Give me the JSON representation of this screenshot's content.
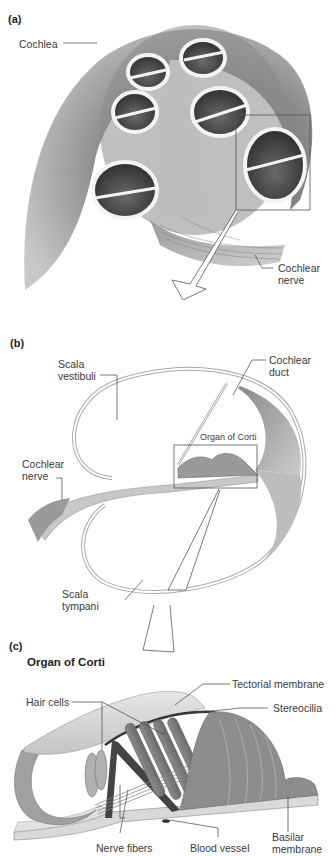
{
  "figure": {
    "panels": [
      {
        "tag": "(a)",
        "labels": {
          "cochlea": "Cochlea",
          "cochlear_nerve_line1": "Cochlear",
          "cochlear_nerve_line2": "nerve"
        }
      },
      {
        "tag": "(b)",
        "labels": {
          "scala_vestibuli_line1": "Scala",
          "scala_vestibuli_line2": "vestibuli",
          "cochlear_duct_line1": "Cochlear",
          "cochlear_duct_line2": "duct",
          "organ_of_corti": "Organ of Corti",
          "cochlear_nerve_line1": "Cochlear",
          "cochlear_nerve_line2": "nerve",
          "scala_tympani_line1": "Scala",
          "scala_tympani_line2": "tympani"
        }
      },
      {
        "tag": "(c)",
        "title": "Organ of Corti",
        "labels": {
          "tectorial_membrane": "Tectorial membrane",
          "hair_cells": "Hair cells",
          "stereocilia": "Stereocilia",
          "nerve_fibers": "Nerve fibers",
          "blood_vessel": "Blood vessel",
          "basilar_membrane_line1": "Basilar",
          "basilar_membrane_line2": "membrane"
        }
      }
    ],
    "colors": {
      "background": "#ffffff",
      "tissue_dark": "#6e6e6e",
      "tissue_mid": "#9a9a9a",
      "tissue_light": "#d4d4d4",
      "leader_line": "#444444",
      "label_text": "#3a3a3a"
    }
  }
}
